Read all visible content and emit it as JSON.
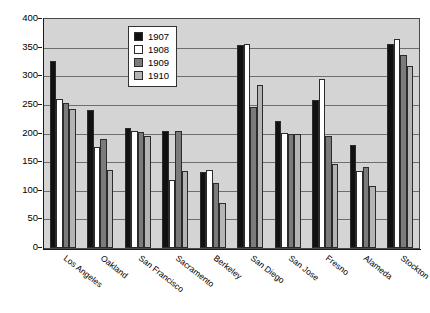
{
  "chart_data": {
    "type": "bar",
    "title": "",
    "subtitle": "",
    "xlabel": "",
    "ylabel": "",
    "ylim": [
      0,
      400
    ],
    "ytick_step": 50,
    "yticks": [
      "0",
      "50",
      "100",
      "150",
      "200",
      "250",
      "300",
      "350",
      "400"
    ],
    "grid": true,
    "legend_position": "top-center-inside",
    "categories": [
      "Los Angeles",
      "Oakland",
      "San Francisco",
      "Sacramento",
      "Berkeley",
      "San Diego",
      "San Jose",
      "Fresno",
      "Alameda",
      "Stockton"
    ],
    "series": [
      {
        "name": "1907",
        "color": "#111111",
        "values": [
          326,
          241,
          209,
          205,
          132,
          355,
          221,
          259,
          180,
          356
        ]
      },
      {
        "name": "1908",
        "color": "#ffffff",
        "values": [
          261,
          177,
          205,
          119,
          137,
          357,
          201,
          296,
          135,
          365
        ]
      },
      {
        "name": "1909",
        "color": "#7b7b7b",
        "values": [
          253,
          190,
          203,
          204,
          113,
          247,
          200,
          196,
          141,
          337
        ]
      },
      {
        "name": "1910",
        "color": "#b4b4b4",
        "values": [
          243,
          136,
          196,
          134,
          79,
          285,
          199,
          147,
          108,
          318
        ]
      }
    ]
  },
  "legend": {
    "entries": [
      {
        "label": "1907",
        "swatch_class": "y1907"
      },
      {
        "label": "1908",
        "swatch_class": "y1908"
      },
      {
        "label": "1909",
        "swatch_class": "y1909"
      },
      {
        "label": "1910",
        "swatch_class": "y1910"
      }
    ]
  },
  "style": {
    "plot_background": "#d4d4d4",
    "gridline_color": "#6e6e6e",
    "axis_color": "#1a1a1a",
    "page_background": "#ffffff"
  }
}
